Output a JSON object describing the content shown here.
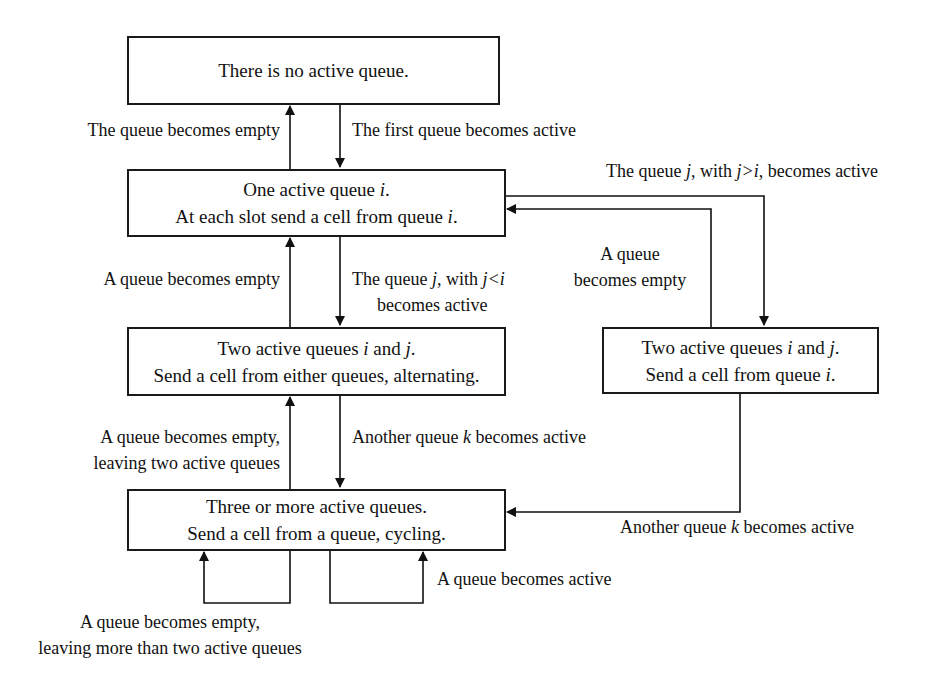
{
  "states": [
    {
      "id": "no_active",
      "lines": [
        "There is no active queue."
      ]
    },
    {
      "id": "one_active",
      "lines": [
        "One active queue i.",
        "At each slot send a cell from queue i."
      ]
    },
    {
      "id": "two_active_alternating",
      "lines": [
        "Two active queues i and j.",
        "Send a cell from either queues, alternating."
      ]
    },
    {
      "id": "two_active_from_i",
      "lines": [
        "Two active queues i and j.",
        "Send a cell from queue i."
      ]
    },
    {
      "id": "three_or_more",
      "lines": [
        "Three or more active queues.",
        "Send a cell from a queue, cycling."
      ]
    }
  ],
  "transitions": [
    {
      "from": "one_active",
      "to": "no_active",
      "label": [
        "The queue becomes empty"
      ]
    },
    {
      "from": "no_active",
      "to": "one_active",
      "label": [
        "The first queue becomes active"
      ]
    },
    {
      "from": "one_active",
      "to": "two_active_from_i",
      "label": [
        "The queue j, with j>i, becomes active"
      ]
    },
    {
      "from": "two_active_from_i",
      "to": "one_active",
      "label": [
        "A queue",
        "becomes empty"
      ]
    },
    {
      "from": "two_active_alternating",
      "to": "one_active",
      "label": [
        "A queue becomes empty"
      ]
    },
    {
      "from": "one_active",
      "to": "two_active_alternating",
      "label": [
        "The queue j, with j<i",
        "becomes active"
      ]
    },
    {
      "from": "three_or_more",
      "to": "two_active_alternating",
      "label": [
        "A queue becomes empty,",
        "leaving two active queues"
      ]
    },
    {
      "from": "two_active_alternating",
      "to": "three_or_more",
      "label": [
        "Another queue k becomes active"
      ]
    },
    {
      "from": "two_active_from_i",
      "to": "three_or_more",
      "label": [
        "Another queue k becomes active"
      ]
    },
    {
      "from": "three_or_more",
      "to": "three_or_more",
      "label": [
        "A queue becomes empty,",
        "leaving more than two active queues"
      ]
    },
    {
      "from": "three_or_more",
      "to": "three_or_more",
      "label": [
        "A queue becomes active"
      ]
    }
  ],
  "text": {
    "box1": "There is no active queue.",
    "box2_l1a": "One active queue ",
    "box2_l1v": "i",
    "box2_l1b": ".",
    "box2_l2a": "At each slot send a cell from queue ",
    "box2_l2v": "i",
    "box2_l2b": ".",
    "box3_l1a": "Two active queues ",
    "box3_l1v1": "i",
    "box3_l1m": " and ",
    "box3_l1v2": "j",
    "box3_l1b": ".",
    "box3_l2": "Send a cell from either queues, alternating.",
    "box4_l1a": "Two active queues ",
    "box4_l1v1": "i",
    "box4_l1m": " and ",
    "box4_l1v2": "j",
    "box4_l1b": ".",
    "box4_l2a": "Send a cell from queue ",
    "box4_l2v": "i",
    "box4_l2b": ".",
    "box5_l1": "Three or more active queues.",
    "box5_l2": "Send a cell from a queue, cycling.",
    "t_empty_top": "The queue becomes empty",
    "t_first_active": "The first queue becomes active",
    "t_jgi_a": "The queue ",
    "t_jgi_v": "j",
    "t_jgi_b": ", with ",
    "t_jgi_c": "j>i",
    "t_jgi_d": ", becomes active",
    "t_aq1": "A queue",
    "t_aq2": "becomes empty",
    "t_empty_mid": "A queue becomes empty",
    "t_jli_a": "The queue ",
    "t_jli_v": "j",
    "t_jli_b": ", with ",
    "t_jli_c": "j<i",
    "t_jli_l2": "becomes active",
    "t_empty2_l1": "A queue becomes empty,",
    "t_empty2_l2": "leaving two active queues",
    "t_k_a": "Another queue ",
    "t_k_v": "k",
    "t_k_b": " becomes active",
    "t_k2_a": "Another queue ",
    "t_k2_v": "k",
    "t_k2_b": " becomes active",
    "t_bot_l1": "A queue becomes empty,",
    "t_bot_l2": "leaving more than two active queues",
    "t_bot_active": "A queue becomes active"
  }
}
